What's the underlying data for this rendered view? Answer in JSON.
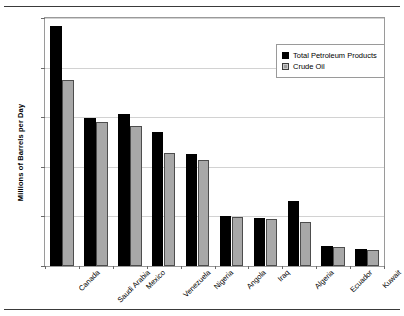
{
  "figure": {
    "clipped_top_caption": "",
    "ylabel": "Millions of Barrels per Day"
  },
  "legend": {
    "items": [
      {
        "label": "Total Petroleum Products",
        "swatch": "black-filled-square"
      },
      {
        "label": "Crude Oil",
        "swatch": "gray-hatched-square"
      }
    ]
  },
  "axis": {
    "y_ticks": [
      "0",
      "0.5",
      "1.0",
      "1.5",
      "2.0",
      "2.5"
    ],
    "y_tick_values": [
      0,
      0.5,
      1.0,
      1.5,
      2.0,
      2.5
    ]
  },
  "chart_data": {
    "type": "bar",
    "title": "",
    "xlabel": "",
    "ylabel": "Millions of Barrels per Day",
    "ylim": [
      0,
      2.5
    ],
    "grid": true,
    "legend_position": "top-right inside plot",
    "categories": [
      "Canada",
      "Saudi Arabia",
      "Mexico",
      "Venezuela",
      "Nigeria",
      "Angola",
      "Iraq",
      "Algeria",
      "Ecuador",
      "Kuwait"
    ],
    "series": [
      {
        "name": "Total Petroleum Products",
        "color": "#000000",
        "values": [
          2.42,
          1.49,
          1.53,
          1.35,
          1.13,
          0.5,
          0.48,
          0.66,
          0.2,
          0.17
        ]
      },
      {
        "name": "Crude Oil",
        "color": "#a8a8a8",
        "values": [
          1.88,
          1.45,
          1.41,
          1.14,
          1.07,
          0.49,
          0.47,
          0.44,
          0.19,
          0.16
        ]
      }
    ]
  }
}
